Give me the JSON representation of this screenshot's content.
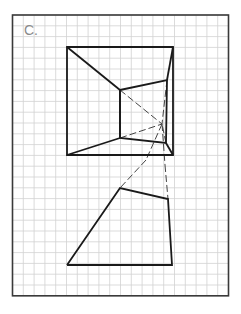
{
  "figure": {
    "label": "C.",
    "grid": {
      "origin": [
        12.5,
        15
      ],
      "cell": 10.8,
      "cols": 20,
      "rows": 26,
      "line_color": "#d2d2d2",
      "frame_color": "#3a3a3a"
    },
    "colors": {
      "stroke": "#1a1a1a",
      "dash": "#444444"
    },
    "front_square": {
      "points": [
        [
          67,
          47
        ],
        [
          173,
          47
        ],
        [
          173,
          155
        ],
        [
          67,
          155
        ]
      ]
    },
    "back_wall": {
      "points": [
        [
          120,
          90
        ],
        [
          167,
          80
        ],
        [
          166,
          143
        ],
        [
          120,
          138
        ]
      ]
    },
    "vanishing_point": [
      162,
      124
    ],
    "solid_lines": [
      [
        [
          67,
          47
        ],
        [
          120,
          90
        ]
      ],
      [
        [
          67,
          155
        ],
        [
          120,
          138
        ]
      ],
      [
        [
          173,
          47
        ],
        [
          167,
          80
        ]
      ],
      [
        [
          173,
          155
        ],
        [
          166,
          143
        ]
      ],
      [
        [
          120,
          90
        ],
        [
          120,
          138
        ]
      ]
    ],
    "dashed_lines": [
      [
        [
          120,
          90
        ],
        [
          162,
          124
        ]
      ],
      [
        [
          120,
          138
        ],
        [
          162,
          124
        ]
      ],
      [
        [
          166,
          143
        ],
        [
          162,
          124
        ]
      ],
      [
        [
          167,
          80
        ],
        [
          162,
          124
        ]
      ],
      [
        [
          162,
          124
        ],
        [
          146,
          160
        ]
      ],
      [
        [
          162,
          124
        ],
        [
          165,
          165
        ]
      ],
      [
        [
          146,
          160
        ],
        [
          120,
          188
        ]
      ],
      [
        [
          165,
          165
        ],
        [
          168,
          199
        ]
      ]
    ],
    "lower_shape": {
      "points": [
        [
          67,
          265
        ],
        [
          120,
          188
        ],
        [
          168,
          199
        ],
        [
          172,
          265
        ]
      ]
    }
  }
}
